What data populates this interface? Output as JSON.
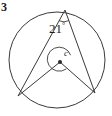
{
  "figure": {
    "question_number": "3",
    "type": "circle-geometry-diagram",
    "stroke_color": "#3a3a3a",
    "text_color": "#1d1d1d",
    "background_color": "#ffffff",
    "labels": {
      "inscribed_angle_value": "21",
      "degree_symbol": "°",
      "center_label": "c"
    },
    "geometry": {
      "circle": {
        "cx": 57,
        "cy": 60,
        "r": 48
      },
      "center_point": {
        "x": 60,
        "y": 62,
        "label": "c"
      },
      "apex_point": {
        "x": 65,
        "y": 10
      },
      "left_base_point": {
        "x": 18,
        "y": 96
      },
      "right_base_point": {
        "x": 95,
        "y": 93
      },
      "apex_arc_radius": 11,
      "center_arc_radius": 12,
      "chords": [
        {
          "from": "apex",
          "to": "left_base"
        },
        {
          "from": "apex",
          "to": "right_base"
        },
        {
          "from": "center",
          "to": "left_base"
        },
        {
          "from": "center",
          "to": "right_base"
        }
      ]
    }
  }
}
